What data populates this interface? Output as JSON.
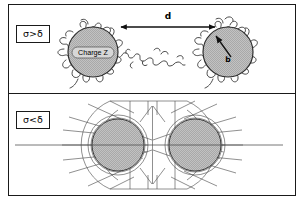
{
  "figure": {
    "border_color": "#1a1a1a",
    "background_color": "#ffffff",
    "sphere_fill_color": "#b9b9b9",
    "line_color": "#3a3a3a"
  },
  "panels": [
    {
      "id": "panel-top",
      "regime_label": "σ>δ",
      "description": "Two polymer-grafted spheres separated by distance d, connected by a bridging random-coil chain",
      "left_sphere": {
        "center_label": "Charge Z",
        "cx": 84,
        "cy": 47,
        "r": 25
      },
      "right_sphere": {
        "radius_label": "b",
        "cx": 219,
        "cy": 47,
        "r": 25
      },
      "separation": {
        "label": "d",
        "arrow": "double-headed",
        "x1": 112,
        "x2": 206,
        "y": 22
      }
    },
    {
      "id": "panel-bottom",
      "regime_label": "σ<δ",
      "description": "Two overlapping dense radial polymer brushes around spheres with a shared outer envelope and a horizontal symmetry axis",
      "left_sphere": {
        "cx": 109,
        "cy": 148,
        "r": 26
      },
      "right_sphere": {
        "cx": 186,
        "cy": 148,
        "r": 26
      },
      "axis_line": {
        "x1": 14,
        "x2": 282,
        "y": 148
      },
      "spoke_count_per_sphere": 20,
      "inner_ring_segment_count": 28
    }
  ]
}
